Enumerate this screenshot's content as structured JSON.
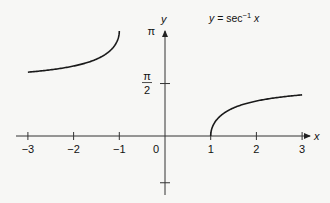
{
  "chart_data": {
    "type": "line",
    "title_parts": {
      "lhs": "y",
      "eq": " = sec",
      "sup": "−1",
      "rhs": " x"
    },
    "xlabel": "x",
    "ylabel": "y",
    "xlim": [
      -3,
      3
    ],
    "ylim": [
      -1.4,
      3.1416
    ],
    "grid": false,
    "legend": "none",
    "x_ticks": [
      {
        "value": -3,
        "label": "−3"
      },
      {
        "value": -2,
        "label": "−2"
      },
      {
        "value": -1,
        "label": "−1"
      },
      {
        "value": 0,
        "label": "0"
      },
      {
        "value": 1,
        "label": "1"
      },
      {
        "value": 2,
        "label": "2"
      },
      {
        "value": 3,
        "label": "3"
      }
    ],
    "y_ticks": [
      {
        "value": 3.1416,
        "label": "π"
      },
      {
        "value": 1.5708,
        "label_num": "π",
        "label_den": "2"
      },
      {
        "value": -1.4,
        "label": ""
      }
    ],
    "series": [
      {
        "name": "arcsec x (x ≤ −1)",
        "x": [
          -3,
          -2.5,
          -2,
          -1.75,
          -1.5,
          -1.25,
          -1.1,
          -1.05,
          -1
        ],
        "y": [
          1.9106,
          1.9823,
          2.0944,
          2.1764,
          2.3005,
          2.4981,
          2.7024,
          2.8323,
          3.1416
        ]
      },
      {
        "name": "arcsec x (x ≥ 1)",
        "x": [
          1,
          1.05,
          1.1,
          1.25,
          1.5,
          1.75,
          2,
          2.5,
          3
        ],
        "y": [
          0,
          0.3093,
          0.4297,
          0.6435,
          0.8411,
          0.9652,
          1.0472,
          1.1593,
          1.231
        ]
      }
    ]
  }
}
